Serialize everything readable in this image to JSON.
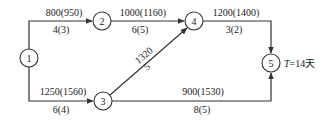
{
  "diagram": {
    "type": "activity-on-arrow network",
    "nodes": [
      {
        "id": "1",
        "label": "1",
        "x": 29,
        "y": 58
      },
      {
        "id": "2",
        "label": "2",
        "x": 102,
        "y": 21
      },
      {
        "id": "3",
        "label": "3",
        "x": 103,
        "y": 101
      },
      {
        "id": "4",
        "label": "4",
        "x": 194,
        "y": 21
      },
      {
        "id": "5",
        "label": "5",
        "x": 271,
        "y": 63
      }
    ],
    "edges": [
      {
        "from": "1",
        "to": "2",
        "cost": "800(950)",
        "duration": "4(3)"
      },
      {
        "from": "2",
        "to": "4",
        "cost": "1000(1160)",
        "duration": "6(5)"
      },
      {
        "from": "4",
        "to": "5",
        "cost": "1200(1400)",
        "duration": "3(2)"
      },
      {
        "from": "1",
        "to": "3",
        "cost": "1250(1560)",
        "duration": "6(4)"
      },
      {
        "from": "3",
        "to": "4",
        "cost": "1320",
        "duration": "5"
      },
      {
        "from": "3",
        "to": "5",
        "cost": "900(1530)",
        "duration": "8(5)"
      }
    ],
    "annotation": {
      "prefix": "T",
      "text": "=14天"
    }
  }
}
